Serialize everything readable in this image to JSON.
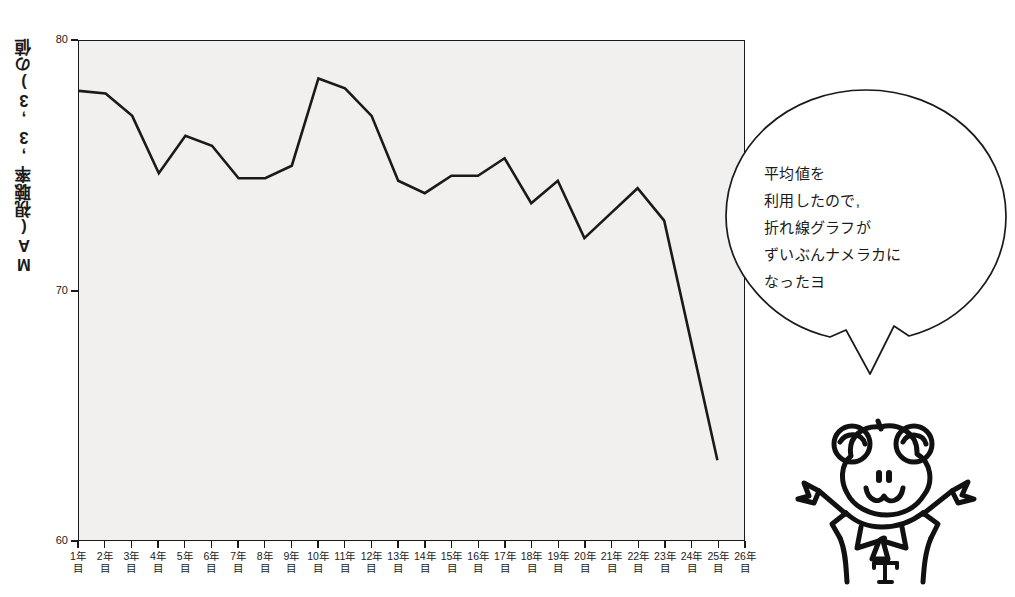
{
  "chart_data": {
    "type": "line",
    "title": "",
    "xlabel": "",
    "ylabel": "MA(視聴率,3,3)の値",
    "ylim": [
      60,
      80
    ],
    "yticks": [
      60,
      70,
      80
    ],
    "ytick_labels": [
      "60",
      "70",
      "80"
    ],
    "grid": false,
    "legend": "none",
    "categories": [
      "1年目",
      "2年目",
      "3年目",
      "4年目",
      "5年目",
      "6年目",
      "7年目",
      "8年目",
      "9年目",
      "10年目",
      "11年目",
      "12年目",
      "13年目",
      "14年目",
      "15年目",
      "16年目",
      "17年目",
      "18年目",
      "19年目",
      "20年目",
      "21年目",
      "22年目",
      "23年目",
      "24年目",
      "25年目",
      "26年目"
    ],
    "values": [
      78.0,
      77.9,
      77.0,
      74.7,
      76.2,
      75.8,
      74.5,
      74.5,
      75.0,
      78.5,
      78.1,
      77.0,
      74.4,
      73.9,
      74.6,
      74.6,
      75.3,
      73.5,
      74.4,
      72.1,
      73.1,
      74.1,
      72.8,
      68.0,
      63.2,
      null
    ],
    "series_color": "#1a1a1a",
    "plot_background": "#f1f0ef"
  },
  "annotation": {
    "balloon_lines": [
      "平均値を",
      "利用したので,",
      "折れ線グラフが",
      "ずいぶんナメラカに",
      "なったヨ"
    ]
  },
  "mascot": {
    "shirt_letter": "T"
  }
}
